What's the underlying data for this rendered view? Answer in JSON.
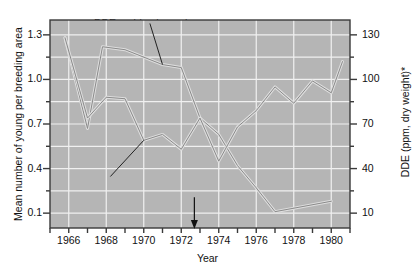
{
  "chart_data": {
    "type": "line",
    "title": "",
    "xlabel": "Year",
    "ylabel": "Mean number of young per breeding area",
    "ylabel_right": "DDE (ppm, dry weight)*",
    "xlim": [
      1965,
      1981
    ],
    "ylim": [
      0.0,
      1.4
    ],
    "ylim_right": [
      0,
      140
    ],
    "xticks": [
      1965,
      1966,
      1967,
      1968,
      1969,
      1970,
      1971,
      1972,
      1973,
      1974,
      1975,
      1976,
      1977,
      1978,
      1979,
      1980,
      1981
    ],
    "xtick_labels": [
      "1966",
      "1968",
      "1970",
      "1972",
      "1974",
      "1976",
      "1978",
      "1980"
    ],
    "xtick_label_years": [
      1966,
      1968,
      1970,
      1972,
      1974,
      1976,
      1978,
      1980
    ],
    "yticks_left": [
      0.1,
      0.25,
      0.4,
      0.55,
      0.7,
      0.85,
      1.0,
      1.15,
      1.3
    ],
    "ytick_labels_left": [
      "0.1",
      "0.4",
      "0.7",
      "1.0",
      "1.3"
    ],
    "ytick_label_values_left": [
      0.1,
      0.4,
      0.7,
      1.0,
      1.3
    ],
    "yticks_right": [
      10,
      25,
      40,
      55,
      70,
      85,
      100,
      115,
      130
    ],
    "ytick_labels_right": [
      "10",
      "40",
      "70",
      "100",
      "130"
    ],
    "ytick_label_values_right": [
      10,
      40,
      70,
      100,
      130
    ],
    "grid": true,
    "legend_position": "inline-annotations",
    "series": [
      {
        "name": "DDE residue in eagle eggs",
        "axis": "right",
        "unit": "ppm, dry weight",
        "x": [
          1965.8,
          1967.0,
          1967.8,
          1969.0,
          1971.0,
          1972.0,
          1973.0,
          1974.0,
          1975.0,
          1976.0,
          1977.0,
          1980.0
        ],
        "values": [
          128,
          67,
          122,
          120,
          110,
          108,
          74,
          63,
          42,
          27,
          11,
          18
        ]
      },
      {
        "name": "Mean number of young per breeding area",
        "axis": "left",
        "x": [
          1965.8,
          1967.0,
          1968.0,
          1969.0,
          1970.0,
          1971.0,
          1972.0,
          1973.0,
          1974.0,
          1975.0,
          1976.0,
          1977.0,
          1978.0,
          1979.0,
          1980.0,
          1980.6
        ],
        "values": [
          1.28,
          0.74,
          0.88,
          0.87,
          0.59,
          0.63,
          0.53,
          0.74,
          0.45,
          0.68,
          0.79,
          0.95,
          0.84,
          0.99,
          0.91,
          1.12
        ]
      }
    ],
    "annotations": [
      {
        "id": "dde-annotation",
        "text": "DDE residue in eagle eggs",
        "x": 1969.9,
        "y_right": 135,
        "leader_to_x": 1971.0,
        "leader_to_y_right": 110
      },
      {
        "id": "young-annotation",
        "text": "Mean number of young",
        "text2": "per breeding area",
        "x": 1967.9,
        "y_left": 0.36,
        "leader_to_x": 1970.0,
        "leader_to_y_left": 0.59
      },
      {
        "id": "ddt-ban-annotation",
        "text": "DDT ban",
        "x": 1972.7,
        "y_left": 0.18,
        "arrow": "down"
      }
    ]
  },
  "colors": {
    "plot_background": "#b5b5b5",
    "gridline": "#f0f0f0",
    "axis": "#3a3a3a",
    "series_line": "#8a8a8a",
    "series_line_outline": "#dedede",
    "text": "#111111",
    "page_background": "#ffffff"
  }
}
